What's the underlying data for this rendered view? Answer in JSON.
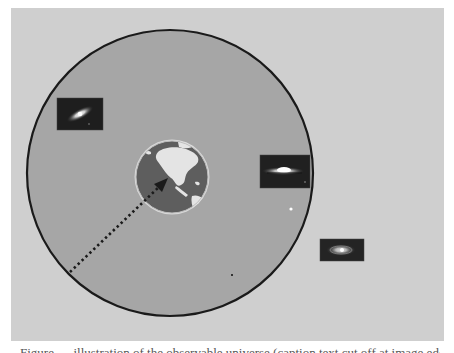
{
  "figure": {
    "colors": {
      "background": "#cfcfcf",
      "sphere_fill": "#a6a6a6",
      "sphere_stroke": "#1a1a1a",
      "earth_ocean": "#5e5e5e",
      "earth_land": "#e6e6e6",
      "arrow": "#1a1a1a",
      "galaxy_frame": "#1c1c1c"
    },
    "sphere": {
      "cx": 170,
      "cy": 173,
      "r": 143
    },
    "earth": {
      "label": "Earth",
      "cx": 172,
      "cy": 177,
      "r": 37
    },
    "radius_arrow": {
      "style": "dotted",
      "x1": 70,
      "y1": 272,
      "x2": 166,
      "y2": 181
    },
    "galaxies": [
      {
        "name": "galaxy-inside-upper-left",
        "x": 57,
        "y": 98,
        "w": 46,
        "h": 32,
        "inside": true
      },
      {
        "name": "galaxy-sombrero-edge",
        "x": 260,
        "y": 155,
        "w": 50,
        "h": 33,
        "inside": true
      },
      {
        "name": "galaxy-outside-spiral",
        "x": 320,
        "y": 239,
        "w": 44,
        "h": 22,
        "inside": false
      }
    ],
    "specks": [
      {
        "x": 291,
        "y": 209,
        "color": "#ffffff"
      },
      {
        "x": 232,
        "y": 275,
        "color": "#333333"
      }
    ],
    "caption": "Figure — illustration of the observable universe (caption text cut off at image edge)"
  }
}
